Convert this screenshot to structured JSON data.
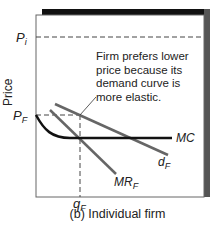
{
  "figure": {
    "caption": "(b) Individual firm",
    "ylabel": "Price",
    "xlabel_tick": "q",
    "xlabel_tick_sub": "F",
    "y_ticks": [
      {
        "label": "P",
        "sub": "i"
      },
      {
        "label": "P",
        "sub": "F"
      }
    ],
    "annotation": [
      "Firm prefers lower",
      "price because its",
      "demand curve is",
      "more elastic."
    ],
    "curves": [
      {
        "label": "MC",
        "sub": ""
      },
      {
        "label": "d",
        "sub": "F"
      },
      {
        "label": "MR",
        "sub": "F"
      }
    ]
  }
}
